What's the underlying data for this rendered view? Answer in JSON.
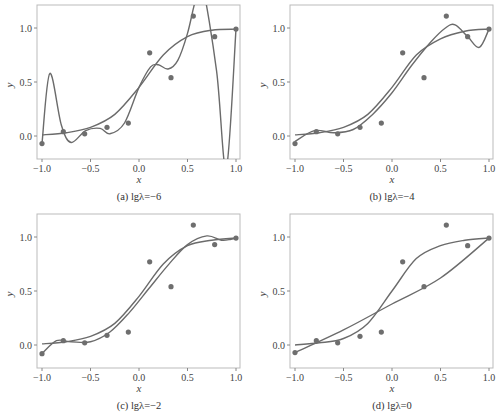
{
  "chart_data": [
    {
      "type": "line",
      "caption": "(a) lgλ=−6",
      "xlabel": "x",
      "ylabel": "y",
      "xlim": [
        -1.05,
        1.05
      ],
      "ylim": [
        -0.2,
        1.2
      ],
      "xticks": [
        "−1.0",
        "−0.5",
        "0.0",
        "0.5",
        "1.0"
      ],
      "yticks": [
        "0.0",
        "0.5",
        "1.0"
      ],
      "grid": false,
      "points": {
        "x": [
          -1.0,
          -0.78,
          -0.56,
          -0.33,
          -0.11,
          0.11,
          0.33,
          0.56,
          0.78,
          1.0
        ],
        "y": [
          -0.07,
          0.04,
          0.02,
          0.08,
          0.12,
          0.77,
          0.54,
          1.11,
          0.92,
          0.99
        ]
      },
      "series": [
        {
          "name": "true function",
          "x": [
            -1,
            -0.75,
            -0.5,
            -0.25,
            0,
            0.25,
            0.5,
            0.75,
            1
          ],
          "y": [
            0.01,
            0.03,
            0.08,
            0.2,
            0.45,
            0.75,
            0.92,
            0.98,
            0.99
          ]
        },
        {
          "name": "fit",
          "x": [
            -1,
            -0.92,
            -0.8,
            -0.7,
            -0.55,
            -0.4,
            -0.3,
            -0.15,
            0,
            0.12,
            0.2,
            0.3,
            0.4,
            0.5,
            0.58,
            0.65,
            0.8,
            0.9,
            1.0
          ],
          "y": [
            -0.07,
            0.58,
            0.1,
            -0.06,
            0.05,
            0.07,
            0.02,
            0.12,
            0.45,
            0.64,
            0.66,
            0.62,
            0.7,
            0.95,
            1.25,
            1.4,
            0.6,
            -0.3,
            0.99
          ]
        }
      ]
    },
    {
      "type": "line",
      "caption": "(b) lgλ=−4",
      "xlabel": "x",
      "ylabel": "y",
      "xlim": [
        -1.05,
        1.05
      ],
      "ylim": [
        -0.2,
        1.2
      ],
      "xticks": [
        "−1.0",
        "−0.5",
        "0.0",
        "0.5",
        "1.0"
      ],
      "yticks": [
        "0.0",
        "0.5",
        "1.0"
      ],
      "grid": false,
      "points": {
        "x": [
          -1.0,
          -0.78,
          -0.56,
          -0.33,
          -0.11,
          0.11,
          0.33,
          0.56,
          0.78,
          1.0
        ],
        "y": [
          -0.07,
          0.04,
          0.02,
          0.08,
          0.12,
          0.77,
          0.54,
          1.11,
          0.92,
          0.99
        ]
      },
      "series": [
        {
          "name": "true function",
          "x": [
            -1,
            -0.75,
            -0.5,
            -0.25,
            0,
            0.25,
            0.5,
            0.75,
            1
          ],
          "y": [
            0.01,
            0.03,
            0.08,
            0.2,
            0.45,
            0.75,
            0.9,
            0.97,
            0.99
          ]
        },
        {
          "name": "fit",
          "x": [
            -1,
            -0.8,
            -0.6,
            -0.4,
            -0.2,
            0,
            0.2,
            0.4,
            0.55,
            0.65,
            0.78,
            0.9,
            1.0
          ],
          "y": [
            -0.05,
            0.05,
            0.03,
            0.06,
            0.2,
            0.4,
            0.65,
            0.87,
            1.0,
            1.03,
            0.92,
            0.82,
            0.99
          ]
        }
      ]
    },
    {
      "type": "line",
      "caption": "(c) lgλ=−2",
      "xlabel": "x",
      "ylabel": "y",
      "xlim": [
        -1.05,
        1.05
      ],
      "ylim": [
        -0.2,
        1.2
      ],
      "xticks": [
        "−1.0",
        "−0.5",
        "0.0",
        "0.5",
        "1.0"
      ],
      "yticks": [
        "0.0",
        "0.5",
        "1.0"
      ],
      "grid": false,
      "points": {
        "x": [
          -1.0,
          -0.78,
          -0.56,
          -0.33,
          -0.11,
          0.11,
          0.33,
          0.56,
          0.78,
          1.0
        ],
        "y": [
          -0.08,
          0.04,
          0.02,
          0.09,
          0.12,
          0.77,
          0.54,
          1.11,
          0.93,
          0.99
        ]
      },
      "series": [
        {
          "name": "true function",
          "x": [
            -1,
            -0.75,
            -0.5,
            -0.25,
            0,
            0.25,
            0.5,
            0.75,
            1
          ],
          "y": [
            0.01,
            0.03,
            0.08,
            0.2,
            0.45,
            0.75,
            0.92,
            0.97,
            0.99
          ]
        },
        {
          "name": "fit",
          "x": [
            -1,
            -0.85,
            -0.7,
            -0.5,
            -0.3,
            -0.1,
            0.1,
            0.3,
            0.5,
            0.7,
            0.85,
            0.95,
            1.0
          ],
          "y": [
            -0.08,
            0.04,
            0.03,
            0.03,
            0.12,
            0.3,
            0.52,
            0.74,
            0.93,
            1.01,
            0.97,
            0.98,
            0.99
          ]
        }
      ]
    },
    {
      "type": "line",
      "caption": "(d) lgλ=0",
      "xlabel": "x",
      "ylabel": "y",
      "xlim": [
        -1.05,
        1.05
      ],
      "ylim": [
        -0.2,
        1.2
      ],
      "xticks": [
        "−1.0",
        "−0.5",
        "0.0",
        "0.5",
        "1.0"
      ],
      "yticks": [
        "0.0",
        "0.5",
        "1.0"
      ],
      "grid": false,
      "points": {
        "x": [
          -1.0,
          -0.78,
          -0.56,
          -0.33,
          -0.11,
          0.11,
          0.33,
          0.56,
          0.78,
          1.0
        ],
        "y": [
          -0.07,
          0.04,
          0.02,
          0.08,
          0.12,
          0.77,
          0.54,
          1.11,
          0.92,
          0.99
        ]
      },
      "series": [
        {
          "name": "true function",
          "x": [
            -1,
            -0.75,
            -0.5,
            -0.25,
            0,
            0.25,
            0.5,
            0.75,
            1
          ],
          "y": [
            0.0,
            0.02,
            0.06,
            0.2,
            0.5,
            0.8,
            0.92,
            0.97,
            0.99
          ]
        },
        {
          "name": "fit",
          "x": [
            -1,
            -0.5,
            0,
            0.5,
            1.0
          ],
          "y": [
            -0.07,
            0.14,
            0.38,
            0.62,
            0.99
          ]
        }
      ]
    }
  ]
}
